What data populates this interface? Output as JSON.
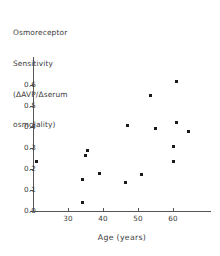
{
  "chart_data": {
    "type": "scatter",
    "title": "",
    "ylabel": "Osmoreceptor Sensitivity (ΔAVP/Δserum osmolality)",
    "ylabel_lines": [
      "Osmoreceptor",
      "Sensitivity",
      "(ΔAVP/Δserum",
      "osmolality)"
    ],
    "xlabel": "Age (years)",
    "xlim": [
      18,
      69
    ],
    "ylim": [
      0.0,
      0.66
    ],
    "grid": false,
    "legend": null,
    "marker": "filled-square",
    "marker_color": "#1a1a1a",
    "axis_color": "#555555",
    "xticks": [
      30,
      40,
      50,
      60
    ],
    "xtick_labels": [
      "30",
      "40",
      "50",
      "60"
    ],
    "yticks": [
      0.0,
      0.1,
      0.2,
      0.3,
      0.4,
      0.5,
      0.6
    ],
    "ytick_labels": [
      "0.0",
      "0.1",
      "0.2",
      "0.3",
      "0.4",
      "0.5",
      "0.6"
    ],
    "n_points": 16,
    "x": [
      21.0,
      34.0,
      34.0,
      35.0,
      35.5,
      39.0,
      46.5,
      47.0,
      51.0,
      53.5,
      55.0,
      60.0,
      60.0,
      61.0,
      61.0,
      64.5
    ],
    "y": [
      0.235,
      0.15,
      0.04,
      0.265,
      0.29,
      0.18,
      0.135,
      0.405,
      0.175,
      0.55,
      0.395,
      0.235,
      0.305,
      0.42,
      0.615,
      0.38
    ],
    "points": [
      {
        "age": 21.0,
        "sensitivity": 0.235
      },
      {
        "age": 34.0,
        "sensitivity": 0.15
      },
      {
        "age": 34.0,
        "sensitivity": 0.04
      },
      {
        "age": 35.0,
        "sensitivity": 0.265
      },
      {
        "age": 35.5,
        "sensitivity": 0.29
      },
      {
        "age": 39.0,
        "sensitivity": 0.18
      },
      {
        "age": 46.5,
        "sensitivity": 0.135
      },
      {
        "age": 47.0,
        "sensitivity": 0.405
      },
      {
        "age": 51.0,
        "sensitivity": 0.175
      },
      {
        "age": 53.5,
        "sensitivity": 0.55
      },
      {
        "age": 55.0,
        "sensitivity": 0.395
      },
      {
        "age": 60.0,
        "sensitivity": 0.235
      },
      {
        "age": 60.0,
        "sensitivity": 0.305
      },
      {
        "age": 61.0,
        "sensitivity": 0.42
      },
      {
        "age": 61.0,
        "sensitivity": 0.615
      },
      {
        "age": 64.5,
        "sensitivity": 0.38
      }
    ]
  }
}
